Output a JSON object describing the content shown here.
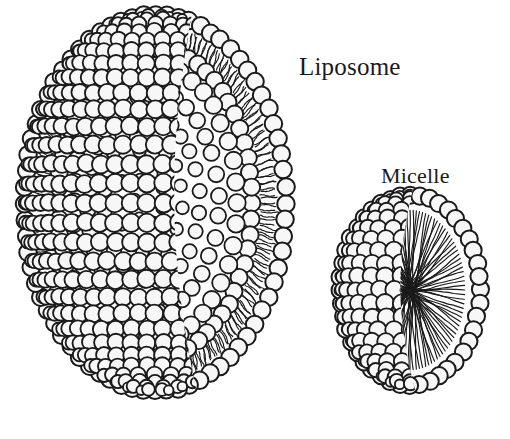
{
  "figure": {
    "background_color": "#ffffff",
    "ink_color": "#1a1a1a",
    "headgroup_fill": "#f7f7f7",
    "width": 510,
    "height": 439
  },
  "labels": {
    "liposome": "Liposome",
    "micelle": "Micelle"
  },
  "structures": {
    "liposome": {
      "name": "Liposome",
      "center_x": 155,
      "center_y": 203,
      "radius_x": 131,
      "radius_y": 188,
      "layer_type": "bilayer",
      "has_aqueous_core": true,
      "headgroup_radius": 9.2,
      "outer_leaflet_label": "outer leaflet head groups",
      "inner_leaflet_label": "inner leaflet head groups",
      "tail_label": "hydrophobic acyl tails",
      "core_label": "aqueous core"
    },
    "micelle": {
      "name": "Micelle",
      "center_x": 410,
      "center_y": 290,
      "radius_x": 70,
      "radius_y": 95,
      "layer_type": "monolayer",
      "has_aqueous_core": false,
      "headgroup_radius": 9.0,
      "outer_leaflet_label": "head groups",
      "tail_label": "hydrophobic acyl tails converging at core"
    }
  }
}
